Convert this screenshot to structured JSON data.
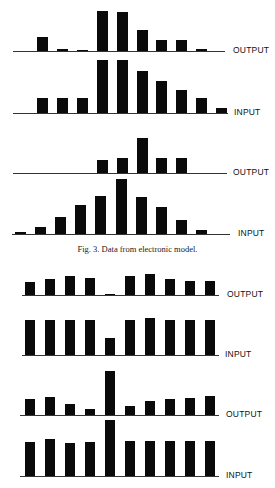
{
  "chart_data": [
    {
      "type": "bar",
      "title": "",
      "label": "OUTPUT",
      "figure": "Fig. 3 (top pair 1)",
      "categories": [
        1,
        2,
        3,
        4,
        5,
        6,
        7,
        8,
        9,
        10
      ],
      "values": [
        14,
        2,
        1,
        40,
        39,
        21,
        11,
        11,
        2,
        0
      ],
      "xlabel": "",
      "ylabel": "",
      "grid": false
    },
    {
      "type": "bar",
      "title": "",
      "label": "INPUT",
      "figure": "Fig. 3 (top pair 1)",
      "categories": [
        1,
        2,
        3,
        4,
        5,
        6,
        7,
        8,
        9,
        10
      ],
      "values": [
        15,
        15,
        15,
        53,
        53,
        42,
        32,
        23,
        15,
        5
      ],
      "xlabel": "",
      "ylabel": "",
      "grid": false
    },
    {
      "type": "bar",
      "title": "",
      "label": "OUTPUT",
      "figure": "Fig. 3 (top pair 2)",
      "categories": [
        1,
        2,
        3,
        4,
        5,
        6,
        7,
        8,
        9,
        10
      ],
      "values": [
        0,
        0,
        0,
        13,
        15,
        35,
        15,
        15,
        0,
        0
      ],
      "xlabel": "",
      "ylabel": "",
      "grid": false
    },
    {
      "type": "bar",
      "title": "",
      "label": "INPUT",
      "figure": "Fig. 3 (top pair 2)",
      "categories": [
        1,
        2,
        3,
        4,
        5,
        6,
        7,
        8,
        9,
        10,
        11
      ],
      "values": [
        2,
        7,
        17,
        29,
        38,
        55,
        37,
        27,
        14,
        4,
        0
      ],
      "xlabel": "",
      "ylabel": "",
      "grid": false
    },
    {
      "type": "bar",
      "title": "",
      "label": "OUTPUT",
      "figure": "bottom pair 1",
      "categories": [
        1,
        2,
        3,
        4,
        5,
        6,
        7,
        8,
        9,
        10
      ],
      "values": [
        13,
        16,
        19,
        17,
        1,
        19,
        21,
        16,
        14,
        14
      ],
      "xlabel": "",
      "ylabel": "",
      "grid": false
    },
    {
      "type": "bar",
      "title": "",
      "label": "INPUT",
      "figure": "bottom pair 1",
      "categories": [
        1,
        2,
        3,
        4,
        5,
        6,
        7,
        8,
        9,
        10
      ],
      "values": [
        35,
        35,
        35,
        35,
        17,
        35,
        37,
        35,
        35,
        35
      ],
      "xlabel": "",
      "ylabel": "",
      "grid": false
    },
    {
      "type": "bar",
      "title": "",
      "label": "OUTPUT",
      "figure": "bottom pair 2",
      "categories": [
        1,
        2,
        3,
        4,
        5,
        6,
        7,
        8,
        9,
        10
      ],
      "values": [
        16,
        18,
        11,
        6,
        44,
        9,
        14,
        16,
        17,
        19
      ],
      "xlabel": "",
      "ylabel": "",
      "grid": false
    },
    {
      "type": "bar",
      "title": "",
      "label": "INPUT",
      "figure": "bottom pair 2",
      "categories": [
        1,
        2,
        3,
        4,
        5,
        6,
        7,
        8,
        9,
        10
      ],
      "values": [
        34,
        37,
        33,
        34,
        56,
        35,
        35,
        35,
        35,
        35
      ],
      "xlabel": "",
      "ylabel": "",
      "grid": false
    }
  ],
  "caption": "Fig. 3. Data from electronic model.",
  "layout": [
    {
      "baseline": 51,
      "x0": 37,
      "step": 19.9,
      "bw": 11,
      "axis_x0": 13,
      "axis_x1": 225,
      "label_x": 233
    },
    {
      "baseline": 113,
      "x0": 37,
      "step": 19.9,
      "bw": 11,
      "axis_x0": 13,
      "axis_x1": 228,
      "label_x": 234
    },
    {
      "baseline": 173,
      "x0": 37,
      "step": 19.9,
      "bw": 11,
      "axis_x0": 13,
      "axis_x1": 227,
      "label_x": 233
    },
    {
      "baseline": 234,
      "x0": 15,
      "step": 20.1,
      "bw": 11,
      "axis_x0": 12,
      "axis_x1": 230,
      "label_x": 238
    },
    {
      "baseline": 295,
      "x0": 25,
      "step": 20,
      "bw": 10,
      "axis_x0": 22,
      "axis_x1": 219,
      "label_x": 227
    },
    {
      "baseline": 355,
      "x0": 25,
      "step": 20,
      "bw": 10,
      "axis_x0": 22,
      "axis_x1": 219,
      "label_x": 225
    },
    {
      "baseline": 415,
      "x0": 25,
      "step": 20,
      "bw": 10,
      "axis_x0": 20,
      "axis_x1": 219,
      "label_x": 226
    },
    {
      "baseline": 476,
      "x0": 25,
      "step": 20,
      "bw": 10,
      "axis_x0": 20,
      "axis_x1": 219,
      "label_x": 226
    }
  ]
}
